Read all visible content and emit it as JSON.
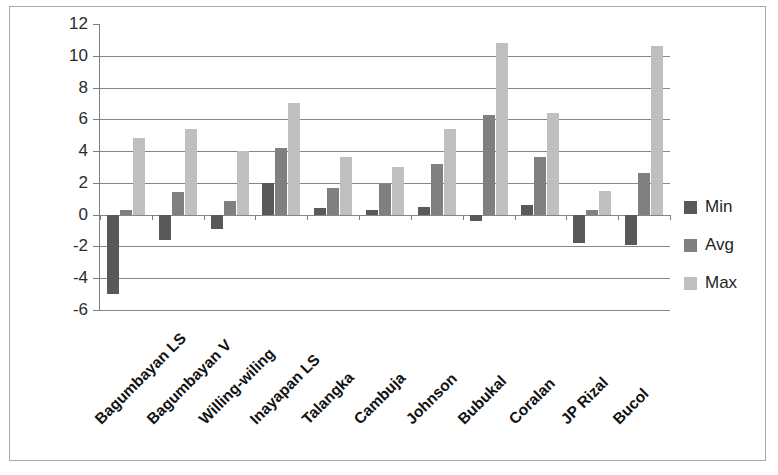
{
  "chart_data": {
    "type": "bar",
    "title": "",
    "subtitle": "",
    "xlabel": "",
    "ylabel": "",
    "ylim": [
      -6,
      12
    ],
    "ytick_step": 2,
    "grid": true,
    "legend_position": "right",
    "categories": [
      "Bagumbayan LS",
      "Bagumbayan V",
      "Willing-wiling",
      "Inayapan LS",
      "Talangka",
      "Cambuja",
      "Johnson",
      "Bubukal",
      "Coralan",
      "JP Rizal",
      "Bucol"
    ],
    "ytick_labels": [
      "12",
      "10",
      "8",
      "6",
      "4",
      "2",
      "0",
      "-2",
      "-4",
      "-6"
    ],
    "ytick_values": [
      12,
      10,
      8,
      6,
      4,
      2,
      0,
      -2,
      -4,
      -6
    ],
    "series": [
      {
        "name": "Min",
        "color": "#595959",
        "values": [
          -5.0,
          -1.6,
          -0.9,
          2.0,
          0.4,
          0.3,
          0.5,
          -0.4,
          0.6,
          -1.8,
          -1.9
        ]
      },
      {
        "name": "Avg",
        "color": "#808080",
        "values": [
          0.3,
          1.4,
          0.85,
          4.2,
          1.7,
          1.9,
          3.2,
          6.3,
          3.6,
          0.3,
          2.6
        ]
      },
      {
        "name": "Max",
        "color": "#bfbfbf",
        "values": [
          4.8,
          5.4,
          4.0,
          7.0,
          3.6,
          3.0,
          5.4,
          10.8,
          6.4,
          1.5,
          10.6
        ]
      }
    ]
  },
  "legend": {
    "items": [
      {
        "label": "Min",
        "color": "#595959"
      },
      {
        "label": "Avg",
        "color": "#808080"
      },
      {
        "label": "Max",
        "color": "#bfbfbf"
      }
    ]
  }
}
